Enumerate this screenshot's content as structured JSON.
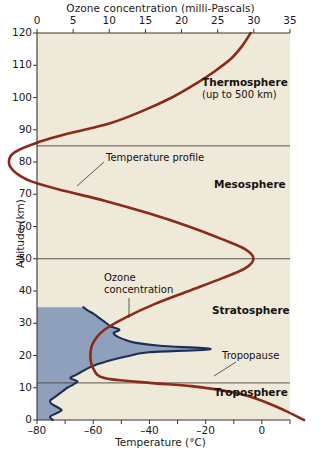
{
  "chart_data": {
    "type": "line",
    "title": "Ozone concentration (milli-Pascals)",
    "xlabel": "Temperature (°C)",
    "ylabel": "Altitude (km)",
    "top_axis_label": "Ozone concentration (milli-Pascals)",
    "bottom_axis_label": "Temperature (°C)",
    "xlim": [
      -80,
      10
    ],
    "ylim": [
      0,
      120
    ],
    "top_xlim": [
      0,
      35
    ],
    "grid": false,
    "legend": "none",
    "x_ticks": [
      -80,
      -60,
      -40,
      -20,
      0
    ],
    "x_tick_labels": [
      "–80",
      "–60",
      "–40",
      "–20",
      "0"
    ],
    "x_minor_ticks": [
      -80,
      -70,
      -60,
      -50,
      -40,
      -30,
      -20,
      -10,
      0,
      10
    ],
    "y_ticks": [
      0,
      10,
      20,
      30,
      40,
      50,
      60,
      70,
      80,
      90,
      100,
      110,
      120
    ],
    "y_tick_labels": [
      "0",
      "10",
      "20",
      "30",
      "40",
      "50",
      "60",
      "70",
      "80",
      "90",
      "100",
      "110",
      "120"
    ],
    "top_ticks": [
      0,
      5,
      10,
      15,
      20,
      25,
      30,
      35
    ],
    "top_tick_labels": [
      "0",
      "5",
      "10",
      "15",
      "20",
      "25",
      "30",
      "35"
    ],
    "series": [
      {
        "name": "Temperature profile",
        "color": "#8a2a18",
        "x_unit": "°C",
        "y_unit": "km",
        "points": [
          [
            15,
            0
          ],
          [
            8,
            3
          ],
          [
            0,
            6
          ],
          [
            -10,
            8.5
          ],
          [
            -25,
            10.5
          ],
          [
            -40,
            11.5
          ],
          [
            -56,
            13
          ],
          [
            -60,
            16
          ],
          [
            -61,
            20
          ],
          [
            -60,
            24
          ],
          [
            -56,
            28
          ],
          [
            -48,
            32
          ],
          [
            -38,
            36
          ],
          [
            -26,
            40
          ],
          [
            -14,
            44
          ],
          [
            -6,
            47
          ],
          [
            -3,
            50
          ],
          [
            -6,
            53
          ],
          [
            -14,
            56
          ],
          [
            -26,
            60
          ],
          [
            -40,
            64
          ],
          [
            -56,
            68
          ],
          [
            -70,
            71
          ],
          [
            -82,
            74
          ],
          [
            -88,
            77
          ],
          [
            -90,
            80
          ],
          [
            -88,
            83
          ],
          [
            -80,
            86
          ],
          [
            -68,
            89
          ],
          [
            -54,
            92
          ],
          [
            -42,
            96
          ],
          [
            -32,
            100
          ],
          [
            -24,
            104
          ],
          [
            -17,
            108
          ],
          [
            -11,
            112
          ],
          [
            -7,
            116
          ],
          [
            -4,
            120
          ]
        ]
      },
      {
        "name": "Ozone concentration",
        "color": "#1d2f52",
        "fill_color": "#8fa0bd",
        "x_unit": "milli-Pascals",
        "y_unit": "km",
        "points": [
          [
            2.2,
            0
          ],
          [
            1.8,
            1
          ],
          [
            2.6,
            2
          ],
          [
            3.4,
            3
          ],
          [
            2.8,
            4
          ],
          [
            2.0,
            5
          ],
          [
            1.8,
            6
          ],
          [
            2.4,
            7
          ],
          [
            3.0,
            8
          ],
          [
            3.6,
            9
          ],
          [
            4.2,
            10
          ],
          [
            5.0,
            11
          ],
          [
            5.6,
            12
          ],
          [
            4.6,
            13
          ],
          [
            5.4,
            14
          ],
          [
            6.2,
            15
          ],
          [
            7.0,
            16
          ],
          [
            8.0,
            17
          ],
          [
            9.4,
            18
          ],
          [
            11.0,
            19
          ],
          [
            13.0,
            20
          ],
          [
            15.5,
            21
          ],
          [
            24.0,
            22
          ],
          [
            17.0,
            23
          ],
          [
            13.5,
            24
          ],
          [
            12.0,
            25
          ],
          [
            11.0,
            26
          ],
          [
            10.6,
            27
          ],
          [
            11.4,
            28
          ],
          [
            10.2,
            29
          ],
          [
            9.6,
            30
          ],
          [
            9.0,
            31
          ],
          [
            8.4,
            32
          ],
          [
            7.8,
            33
          ],
          [
            7.0,
            34
          ],
          [
            6.4,
            35
          ]
        ]
      }
    ],
    "layers": [
      {
        "name": "Thermosphere",
        "sublabel": "(up to 500 km)",
        "base_km": 85,
        "top_km": 120
      },
      {
        "name": "Mesosphere",
        "sublabel": "",
        "base_km": 50,
        "top_km": 85
      },
      {
        "name": "Stratosphere",
        "sublabel": "",
        "base_km": 11.5,
        "top_km": 50
      },
      {
        "name": "Troposphere",
        "sublabel": "",
        "base_km": 0,
        "top_km": 11.5
      }
    ],
    "boundaries_km": [
      11.5,
      50,
      85
    ],
    "annotations": [
      {
        "text": "Temperature profile",
        "points_to_km": 78
      },
      {
        "text": "Ozone",
        "text2": "concentration",
        "points_to_km": 31
      },
      {
        "text": "Tropopause",
        "points_to_km": 11.5
      }
    ]
  },
  "axes": {
    "top_title": "Ozone concentration (milli-Pascals)",
    "bottom_title": "Temperature (°C)",
    "left_title": "Altitude (km)"
  },
  "layer_labels": {
    "thermosphere": "Thermosphere",
    "thermosphere_sub": "(up to 500 km)",
    "mesosphere": "Mesosphere",
    "stratosphere": "Stratosphere",
    "troposphere": "Troposphere"
  },
  "annotations": {
    "temperature_profile": "Temperature profile",
    "ozone_line1": "Ozone",
    "ozone_line2": "concentration",
    "tropopause": "Tropopause"
  },
  "colors": {
    "temperature_curve": "#8a2a18",
    "ozone_curve": "#1d2f52",
    "ozone_fill": "#8fa0bd",
    "plot_bg": "#efe9da",
    "page_bg": "#ffffff",
    "axis": "#3b342c"
  }
}
